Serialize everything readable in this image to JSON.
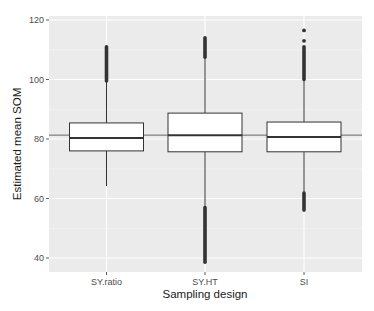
{
  "chart_data": {
    "type": "boxplot",
    "title": "",
    "xlabel": "Sampling design",
    "ylabel": "Estimated mean SOM",
    "categories": [
      "SY.ratio",
      "SY.HT",
      "SI"
    ],
    "ylim": [
      35,
      121
    ],
    "yticks": [
      40,
      60,
      80,
      100,
      120
    ],
    "grid": true,
    "reference_line": 81.3,
    "boxes": [
      {
        "name": "SY.ratio",
        "lower_whisker": 64.2,
        "q1": 76.0,
        "median": 80.3,
        "q3": 85.4,
        "upper_whisker": 99.5,
        "outliers_low": [],
        "outliers_high_range": [
          99.5,
          111.0
        ],
        "outliers_high_points": []
      },
      {
        "name": "SY.HT",
        "lower_whisker": 57.0,
        "q1": 75.7,
        "median": 81.3,
        "q3": 88.7,
        "upper_whisker": 107.5,
        "outliers_low_range": [
          38.6,
          57.0
        ],
        "outliers_high_range": [
          107.5,
          114.0
        ],
        "outliers_high_points": []
      },
      {
        "name": "SI",
        "lower_whisker": 61.8,
        "q1": 75.7,
        "median": 80.7,
        "q3": 85.7,
        "upper_whisker": 100.0,
        "outliers_low_range": [
          56.1,
          61.8
        ],
        "outliers_high_range": [
          100.0,
          111.0
        ],
        "outliers_high_points": [
          113.0,
          116.5
        ]
      }
    ]
  },
  "colors": {
    "panel_bg": "#ebebeb",
    "grid_major": "#ffffff",
    "grid_minor": "#f5f5f5",
    "box_fill": "#ffffff",
    "box_line": "#333333",
    "ref_line": "#666666"
  }
}
